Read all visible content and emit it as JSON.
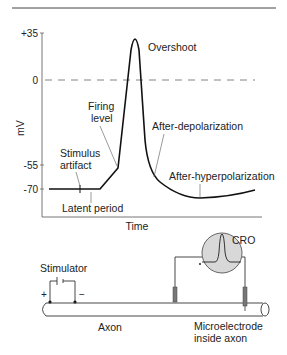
{
  "graph": {
    "y_axis_label": "mV",
    "x_axis_label": "Time",
    "y_ticks": [
      "+35",
      "0",
      "-55",
      "-70"
    ],
    "annotations": {
      "overshoot": "Overshoot",
      "firing_level_line1": "Firing",
      "firing_level_line2": "level",
      "after_depolarization": "After-depolarization",
      "stimulus_artifact_line1": "Stimulus",
      "stimulus_artifact_line2": "artifact",
      "after_hyperpolarization": "After-hyperpolarization",
      "latent_period": "Latent period"
    }
  },
  "apparatus": {
    "stimulator": "Stimulator",
    "plus": "+",
    "minus": "−",
    "cro": "CRO",
    "axon": "Axon",
    "microelectrode_line1": "Microelectrode",
    "microelectrode_line2": "inside axon"
  },
  "colors": {
    "trace": "#111111",
    "axis": "#666666",
    "text": "#222222",
    "cro_fill": "#d8d8d8",
    "electrode": "#777777"
  }
}
